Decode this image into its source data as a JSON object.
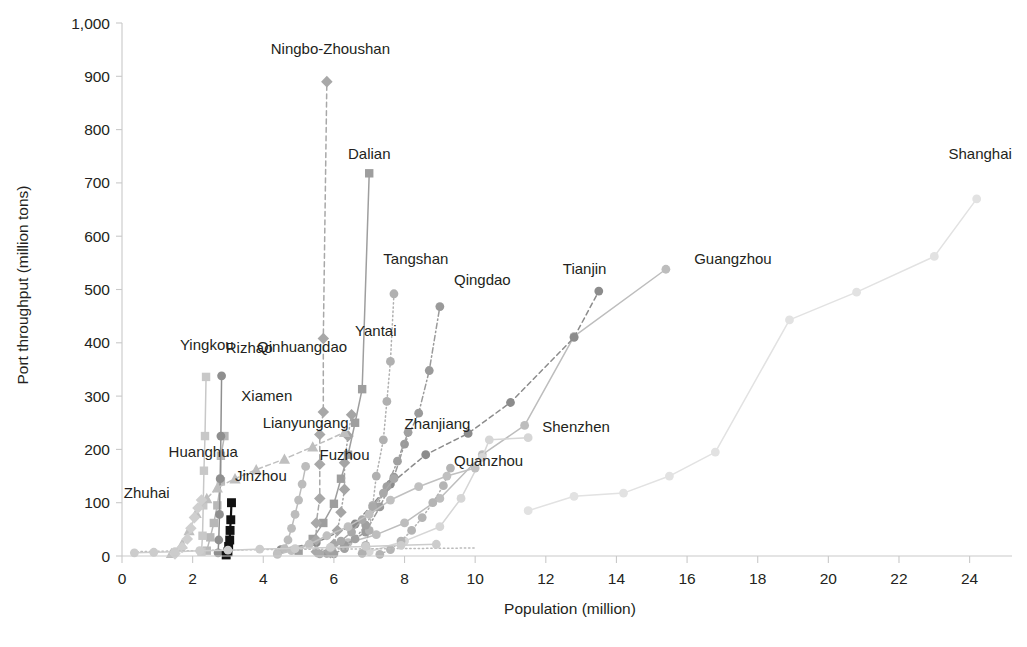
{
  "chart_data": {
    "type": "line",
    "title": "",
    "xlabel": "Population (million)",
    "ylabel": "Port throughput (million tons)",
    "xlim": [
      0,
      25.2
    ],
    "ylim": [
      0,
      1000
    ],
    "xticks": [
      0,
      2,
      4,
      6,
      8,
      10,
      12,
      14,
      16,
      18,
      20,
      22,
      24
    ],
    "yticks": [
      0,
      100,
      200,
      300,
      400,
      500,
      600,
      700,
      800,
      900,
      1000
    ],
    "ytick_labels": [
      "0",
      "100",
      "200",
      "300",
      "400",
      "500",
      "600",
      "700",
      "800",
      "900",
      "1,000"
    ],
    "grid": false,
    "legend": "inline-labels",
    "series": [
      {
        "name": "Shanghai",
        "color": "#e2e2e2",
        "marker": "circle",
        "dash": "solid",
        "label_x": 24.3,
        "label_y": 745,
        "label_anchor": "middle",
        "points": [
          [
            11.5,
            85
          ],
          [
            12.8,
            112
          ],
          [
            14.2,
            118
          ],
          [
            15.5,
            150
          ],
          [
            16.8,
            195
          ],
          [
            18.9,
            443
          ],
          [
            20.8,
            495
          ],
          [
            23.0,
            562
          ],
          [
            24.2,
            670
          ]
        ]
      },
      {
        "name": "Guangzhou",
        "color": "#bdbdbd",
        "marker": "circle",
        "dash": "solid",
        "label_x": 16.2,
        "label_y": 548,
        "label_anchor": "start",
        "points": [
          [
            6.4,
            25
          ],
          [
            7.2,
            40
          ],
          [
            8.0,
            62
          ],
          [
            9.0,
            108
          ],
          [
            10.2,
            190
          ],
          [
            11.4,
            245
          ],
          [
            12.8,
            412
          ],
          [
            15.4,
            538
          ]
        ]
      },
      {
        "name": "Tianjin",
        "color": "#8c8c8c",
        "marker": "circle",
        "dash": "dash",
        "label_x": 13.1,
        "label_y": 530,
        "label_anchor": "middle",
        "points": [
          [
            4.5,
            12
          ],
          [
            5.5,
            25
          ],
          [
            6.6,
            60
          ],
          [
            7.6,
            135
          ],
          [
            8.6,
            190
          ],
          [
            9.8,
            230
          ],
          [
            11.0,
            288
          ],
          [
            12.8,
            410
          ],
          [
            13.5,
            497
          ]
        ]
      },
      {
        "name": "Shenzhen",
        "color": "#d6d6d6",
        "marker": "circle",
        "dash": "solid",
        "label_x": 11.9,
        "label_y": 232,
        "label_anchor": "start",
        "points": [
          [
            7.0,
            8
          ],
          [
            8.0,
            28
          ],
          [
            9.0,
            55
          ],
          [
            9.6,
            108
          ],
          [
            10.2,
            185
          ],
          [
            10.4,
            218
          ],
          [
            11.5,
            222
          ]
        ]
      },
      {
        "name": "Qingdao",
        "color": "#9a9a9a",
        "marker": "circle",
        "dash": "dashdot",
        "label_x": 9.4,
        "label_y": 508,
        "label_anchor": "start",
        "points": [
          [
            5.8,
            5
          ],
          [
            6.3,
            20
          ],
          [
            6.9,
            45
          ],
          [
            7.3,
            92
          ],
          [
            7.7,
            148
          ],
          [
            8.0,
            210
          ],
          [
            8.4,
            268
          ],
          [
            8.7,
            348
          ],
          [
            9.0,
            468
          ]
        ]
      },
      {
        "name": "Tangshan",
        "color": "#b0b0b0",
        "marker": "circle",
        "dash": "dot",
        "label_x": 7.4,
        "label_y": 548,
        "label_anchor": "start",
        "points": [
          [
            6.8,
            5
          ],
          [
            6.9,
            20
          ],
          [
            7.0,
            48
          ],
          [
            7.1,
            95
          ],
          [
            7.2,
            150
          ],
          [
            7.4,
            218
          ],
          [
            7.5,
            290
          ],
          [
            7.6,
            365
          ],
          [
            7.7,
            492
          ]
        ]
      },
      {
        "name": "Dalian",
        "color": "#9e9e9e",
        "marker": "square",
        "dash": "solid",
        "label_x": 7.0,
        "label_y": 745,
        "label_anchor": "middle",
        "points": [
          [
            5.0,
            10
          ],
          [
            5.4,
            32
          ],
          [
            5.7,
            62
          ],
          [
            6.0,
            98
          ],
          [
            6.2,
            145
          ],
          [
            6.4,
            190
          ],
          [
            6.6,
            250
          ],
          [
            6.8,
            313
          ],
          [
            7.0,
            718
          ]
        ]
      },
      {
        "name": "Ningbo-Zhoushan",
        "color": "#a8a8a8",
        "marker": "diamond",
        "dash": "dash",
        "label_x": 5.9,
        "label_y": 942,
        "label_anchor": "middle",
        "points": [
          [
            5.5,
            8
          ],
          [
            5.5,
            30
          ],
          [
            5.5,
            62
          ],
          [
            5.6,
            108
          ],
          [
            5.6,
            172
          ],
          [
            5.6,
            228
          ],
          [
            5.7,
            270
          ],
          [
            5.7,
            408
          ],
          [
            5.8,
            890
          ]
        ]
      },
      {
        "name": "Qinhuangdao",
        "color": "#b8b8b8",
        "marker": "square",
        "dash": "solid",
        "label_x": 5.1,
        "label_y": 382,
        "label_anchor": "middle",
        "points": [
          [
            2.4,
            10
          ],
          [
            2.5,
            35
          ],
          [
            2.6,
            62
          ],
          [
            2.7,
            95
          ],
          [
            2.8,
            140
          ],
          [
            2.8,
            188
          ],
          [
            2.9,
            225
          ]
        ]
      },
      {
        "name": "Yantai",
        "color": "#a5a5a5",
        "marker": "diamond",
        "dash": "dot",
        "label_x": 6.6,
        "label_y": 412,
        "label_anchor": "start",
        "points": [
          [
            5.9,
            6
          ],
          [
            6.0,
            22
          ],
          [
            6.1,
            48
          ],
          [
            6.2,
            82
          ],
          [
            6.3,
            125
          ],
          [
            6.3,
            175
          ],
          [
            6.4,
            225
          ],
          [
            6.5,
            265
          ]
        ]
      },
      {
        "name": "Lianyungang",
        "color": "#bcbcbc",
        "marker": "circle",
        "dash": "solid",
        "label_x": 5.2,
        "label_y": 240,
        "label_anchor": "middle",
        "points": [
          [
            4.4,
            5
          ],
          [
            4.6,
            14
          ],
          [
            4.7,
            30
          ],
          [
            4.8,
            52
          ],
          [
            4.9,
            78
          ],
          [
            5.0,
            105
          ],
          [
            5.1,
            135
          ],
          [
            5.2,
            168
          ]
        ]
      },
      {
        "name": "Zhanjiang",
        "color": "#a0a0a0",
        "marker": "circle",
        "dash": "dashdot",
        "label_x": 8.0,
        "label_y": 238,
        "label_anchor": "start",
        "points": [
          [
            6.0,
            4
          ],
          [
            6.3,
            14
          ],
          [
            6.6,
            32
          ],
          [
            6.9,
            58
          ],
          [
            7.2,
            92
          ],
          [
            7.5,
            130
          ],
          [
            7.8,
            178
          ],
          [
            8.1,
            232
          ]
        ]
      },
      {
        "name": "Fuzhou",
        "color": "#a9a9a9",
        "marker": "circle",
        "dash": "solid",
        "label_x": 6.3,
        "label_y": 180,
        "label_anchor": "middle",
        "points": [
          [
            5.6,
            4
          ],
          [
            5.9,
            14
          ],
          [
            6.2,
            28
          ],
          [
            6.5,
            45
          ],
          [
            6.8,
            68
          ],
          [
            7.1,
            92
          ],
          [
            7.4,
            118
          ],
          [
            7.7,
            145
          ]
        ]
      },
      {
        "name": "Quanzhou",
        "color": "#b4b4b4",
        "marker": "circle",
        "dash": "dot",
        "label_x": 9.4,
        "label_y": 168,
        "label_anchor": "start",
        "points": [
          [
            7.3,
            3
          ],
          [
            7.6,
            12
          ],
          [
            7.9,
            28
          ],
          [
            8.2,
            48
          ],
          [
            8.5,
            72
          ],
          [
            8.8,
            100
          ],
          [
            9.1,
            132
          ],
          [
            9.3,
            165
          ]
        ]
      },
      {
        "name": "Xiamen",
        "color": "#c0c0c0",
        "marker": "circle",
        "dash": "solid",
        "label_x": 4.1,
        "label_y": 290,
        "label_anchor": "middle",
        "points": [
          [
            4.4,
            3
          ],
          [
            4.8,
            10
          ],
          [
            5.3,
            22
          ],
          [
            5.8,
            38
          ],
          [
            6.4,
            55
          ],
          [
            7.0,
            78
          ],
          [
            7.6,
            105
          ],
          [
            8.4,
            130
          ],
          [
            9.2,
            150
          ],
          [
            10.0,
            165
          ]
        ]
      },
      {
        "name": "Yingkou",
        "color": "#c8c8c8",
        "marker": "square",
        "dash": "solid",
        "label_x": 2.4,
        "label_y": 386,
        "label_anchor": "middle",
        "points": [
          [
            2.25,
            8
          ],
          [
            2.28,
            38
          ],
          [
            2.3,
            95
          ],
          [
            2.32,
            160
          ],
          [
            2.35,
            225
          ],
          [
            2.38,
            336
          ]
        ]
      },
      {
        "name": "Rizhao",
        "color": "#8f8f8f",
        "marker": "circle",
        "dash": "solid",
        "label_x": 3.6,
        "label_y": 380,
        "label_anchor": "middle",
        "points": [
          [
            2.72,
            6
          ],
          [
            2.74,
            30
          ],
          [
            2.76,
            78
          ],
          [
            2.78,
            145
          ],
          [
            2.8,
            225
          ],
          [
            2.82,
            338
          ]
        ]
      },
      {
        "name": "Jinzhou",
        "color": "#111111",
        "marker": "square",
        "dash": "solid",
        "label_x": 3.2,
        "label_y": 140,
        "label_anchor": "start",
        "points": [
          [
            2.95,
            2
          ],
          [
            3.0,
            8
          ],
          [
            3.02,
            18
          ],
          [
            3.05,
            30
          ],
          [
            3.06,
            48
          ],
          [
            3.08,
            68
          ],
          [
            3.1,
            100
          ]
        ]
      },
      {
        "name": "Huanghua",
        "color": "#bfbfbf",
        "marker": "triangle",
        "dash": "dash",
        "label_x": 2.3,
        "label_y": 185,
        "label_anchor": "middle",
        "points": [
          [
            1.4,
            5
          ],
          [
            1.7,
            22
          ],
          [
            1.9,
            48
          ],
          [
            2.1,
            80
          ],
          [
            2.4,
            108
          ],
          [
            2.7,
            128
          ],
          [
            3.2,
            145
          ],
          [
            3.8,
            162
          ],
          [
            4.6,
            182
          ],
          [
            5.4,
            205
          ],
          [
            6.3,
            232
          ]
        ]
      },
      {
        "name": "Zhuhai",
        "color": "#cfcfcf",
        "marker": "diamond",
        "dash": "solid",
        "label_x": 0.7,
        "label_y": 108,
        "label_anchor": "middle",
        "points": [
          [
            1.5,
            4
          ],
          [
            1.7,
            16
          ],
          [
            1.85,
            32
          ],
          [
            1.95,
            52
          ],
          [
            2.05,
            72
          ],
          [
            2.15,
            90
          ],
          [
            2.25,
            105
          ]
        ]
      },
      {
        "name": "baseline-dotted",
        "color": "#bbbbbb",
        "marker": "none",
        "dash": "dot",
        "label_x": null,
        "label_y": null,
        "label_anchor": "middle",
        "points": [
          [
            0.3,
            8
          ],
          [
            2.0,
            10
          ],
          [
            4.0,
            12
          ],
          [
            6.0,
            13
          ],
          [
            8.0,
            14
          ],
          [
            10.0,
            15
          ]
        ]
      },
      {
        "name": "baseline-low",
        "color": "#cccccc",
        "marker": "circle",
        "dash": "solid",
        "label_x": null,
        "label_y": null,
        "label_anchor": "middle",
        "points": [
          [
            0.35,
            6
          ],
          [
            0.9,
            7
          ],
          [
            1.5,
            8
          ],
          [
            2.2,
            10
          ],
          [
            3.0,
            11
          ],
          [
            3.9,
            13
          ],
          [
            4.9,
            14
          ],
          [
            5.9,
            16
          ],
          [
            6.9,
            18
          ],
          [
            7.9,
            20
          ],
          [
            8.9,
            22
          ]
        ]
      }
    ]
  },
  "axes": {
    "x_title": "Population (million)",
    "y_title": "Port throughput (million tons)"
  }
}
